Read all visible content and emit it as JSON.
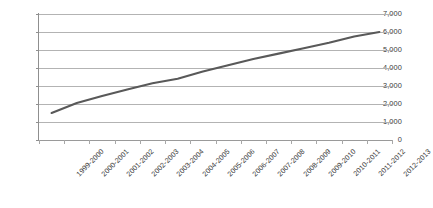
{
  "chart_data": {
    "type": "line",
    "title": "",
    "subtitle": "",
    "xlabel": "",
    "ylabel": "",
    "categories": [
      "1999-2000",
      "2000-2001",
      "2001-2002",
      "2002-2003",
      "2003-2004",
      "2004-2005",
      "2005-2006",
      "2006-2007",
      "2007-2008",
      "2008-2009",
      "2009-2010",
      "2010-2011",
      "2011-2012",
      "2012-2013"
    ],
    "values": [
      1500,
      2050,
      2450,
      2800,
      3150,
      3400,
      3800,
      4150,
      4500,
      4800,
      5100,
      5400,
      5750,
      6000
    ],
    "series": [
      {
        "name": "",
        "color": "#595959",
        "values": [
          1500,
          2050,
          2450,
          2800,
          3150,
          3400,
          3800,
          4150,
          4500,
          4800,
          5100,
          5400,
          5750,
          6000
        ]
      }
    ],
    "ylim": [
      0,
      7000
    ],
    "y_ticks": [
      0,
      1000,
      2000,
      3000,
      4000,
      5000,
      6000,
      7000
    ],
    "y_tick_labels": [
      "0",
      "1,000",
      "2,000",
      "3,000",
      "4,000",
      "5,000",
      "6,000",
      "7,000"
    ],
    "grid": true,
    "grid_axis": "y",
    "legend": false,
    "legend_position": "none",
    "markers": false,
    "x_tick_label_rotation": -45,
    "colors": {
      "series_line": "#595959",
      "gridline": "#b3b3b3",
      "axis": "#8f8f8f",
      "tick_text": "#3b3b3b",
      "background": "#ffffff"
    }
  }
}
